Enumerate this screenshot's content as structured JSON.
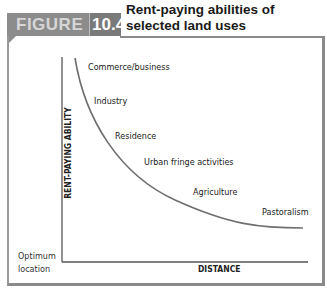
{
  "header": {
    "figure_word": "FIGURE",
    "figure_number": "10.4",
    "title_line1": "Rent-paying abilities of",
    "title_line2": "selected land uses"
  },
  "axes": {
    "y_label": "RENT-PAYING ABILITY",
    "x_label": "DISTANCE",
    "origin_line1": "Optimum",
    "origin_line2": "location"
  },
  "curve_labels": [
    {
      "label": "Commerce/business",
      "x": 88,
      "y": 61
    },
    {
      "label": "Industry",
      "x": 94,
      "y": 95
    },
    {
      "label": "Residence",
      "x": 115,
      "y": 135
    },
    {
      "label": "Urban fringe activities",
      "x": 144,
      "y": 158
    },
    {
      "label": "Agriculture",
      "x": 193,
      "y": 188
    },
    {
      "label": "Pastoralism",
      "x": 262,
      "y": 208
    }
  ],
  "colors": {
    "header_band": "#8c8c8c",
    "header_number_box": "#7a7a7a",
    "curve": "#6e6e6e",
    "axis": "#555555",
    "frame": "#8a8a8a"
  }
}
